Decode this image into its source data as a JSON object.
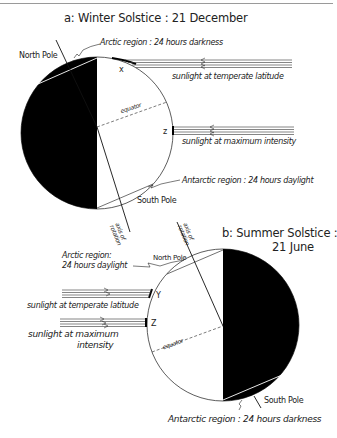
{
  "diagram_a": {
    "title": "a: Winter Solstice : 21 December",
    "labels": {
      "north_pole": "North Pole",
      "arctic_region": "Arctic region : 24 hours darkness",
      "sunlight_temperate": "sunlight at temperate latitude",
      "sunlight_maximum": "sunlight at maximum intensity",
      "equator": "equator",
      "antarctic_region": "Antarctic region : 24 hours daylight",
      "south_pole": "South Pole",
      "axis": "axis of rotation",
      "point_x": "x",
      "point_z": "z"
    }
  },
  "diagram_b": {
    "title_line1": "b: Summer Solstice :",
    "title_line2": "21 June",
    "labels": {
      "arctic_region_line1": "Arctic region:",
      "arctic_region_line2": "24 hours daylight",
      "north_pole": "North Pole",
      "sunlight_temperate": "sunlight at temperate latitude",
      "sunlight_maximum_line1": "sunlight at maximum",
      "sunlight_maximum_line2": "intensity",
      "equator": "equator",
      "south_pole": "South Pole",
      "antarctic_region": "Antarctic region : 24 hours darkness",
      "axis": "axis of rotation",
      "point_y": "Y",
      "point_z": "Z"
    }
  },
  "colors": {
    "ink": "#111111",
    "night": "#000000",
    "day": "#ffffff"
  }
}
